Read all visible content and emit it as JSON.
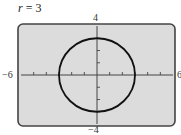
{
  "chart_data": {
    "type": "line",
    "title": "r = 3",
    "title_var": "r",
    "title_value": "3",
    "xlim": [
      -6,
      6
    ],
    "ylim": [
      -4,
      4
    ],
    "xscale": 1,
    "yscale": 1,
    "tick_labels": {
      "x_min": "−6",
      "x_max": "6",
      "y_max": "4",
      "y_min": "−4"
    },
    "grid": false,
    "series": [
      {
        "name": "r = 3",
        "shape": "circle",
        "center": [
          0,
          0
        ],
        "radius": 3
      }
    ]
  },
  "colors": {
    "plot_bg": "#dcdcdc",
    "frame": "#444444",
    "curve": "#111111",
    "axis": "#444444"
  }
}
